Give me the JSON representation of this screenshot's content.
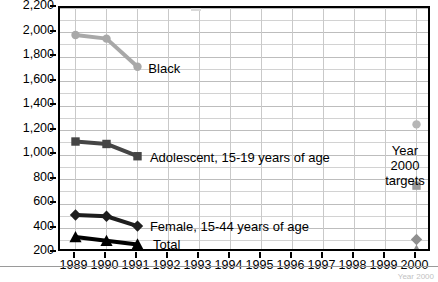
{
  "chart_data": {
    "type": "line",
    "title": "",
    "xlabel": "",
    "ylabel": "",
    "x": [
      1989,
      1990,
      1991,
      1992,
      1993,
      1994,
      1995,
      1996,
      1997,
      1998,
      1999,
      2000
    ],
    "xlim": [
      1988.5,
      2000.5
    ],
    "ylim": [
      200,
      2200
    ],
    "ytick_labels": [
      "2,200",
      "2,000",
      "1,800",
      "1,600",
      "1,400",
      "1,200",
      "1,000",
      "800",
      "600",
      "400",
      "200"
    ],
    "ytick_values": [
      2200,
      2000,
      1800,
      1600,
      1400,
      1200,
      1000,
      800,
      600,
      400,
      200
    ],
    "xtick_labels": [
      "1989",
      "1990",
      "1991",
      "1992",
      "1993",
      "1994",
      "1995",
      "1996",
      "1997",
      "1998",
      "1999",
      "2000"
    ],
    "grid": "horizontal gridlines every 100 units, vertical gridlines at each year",
    "legend": "inline labels at end of each line",
    "series": [
      {
        "name": "Black",
        "label": "Black",
        "marker": "circle",
        "color": "#a8a8a8",
        "x": [
          1989,
          1990,
          1991
        ],
        "values": [
          1980,
          1950,
          1720
        ],
        "target_year": 2000,
        "target_value": 1250
      },
      {
        "name": "Adolescent, 15-19 years of age",
        "label": "Adolescent, 15-19 years of age",
        "marker": "square",
        "color": "#454545",
        "x": [
          1989,
          1990,
          1991
        ],
        "values": [
          1110,
          1090,
          990
        ],
        "target_year": 2000,
        "target_value": 750
      },
      {
        "name": "Female, 15-44 years of age",
        "label": "Female, 15-44 years of age",
        "marker": "diamond",
        "color": "#1d1d1d",
        "x": [
          1989,
          1990,
          1991
        ],
        "values": [
          510,
          500,
          420
        ],
        "target_year": 2000,
        "target_value": 310
      },
      {
        "name": "Total",
        "label": "Total",
        "marker": "triangle",
        "color": "#000000",
        "x": [
          1989,
          1990,
          1991
        ],
        "values": [
          330,
          300,
          270
        ],
        "target_year": 2000,
        "target_value": 220
      }
    ],
    "annotations": [
      {
        "text": "Black",
        "x": 1991.35,
        "y": 1700
      },
      {
        "text": "Adolescent, 15-19 years of age",
        "x": 1991.4,
        "y": 975
      },
      {
        "text": "Female, 15-44 years of age",
        "x": 1991.4,
        "y": 410
      },
      {
        "text": "Total",
        "x": 1991.5,
        "y": 262
      }
    ],
    "target_note": {
      "line1": "Year",
      "line2": "2000",
      "line3": "targets"
    }
  },
  "footer": {
    "note": "Year 2000"
  }
}
